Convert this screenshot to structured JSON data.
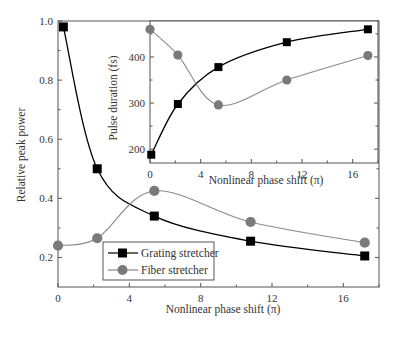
{
  "chart_data": [
    {
      "type": "line",
      "title": "",
      "xlabel": "Nonlinear phase shift (π)",
      "ylabel": "Relative peak power",
      "xlim": [
        0,
        18
      ],
      "ylim": [
        0.1,
        1.0
      ],
      "xticks": [
        "0",
        "4",
        "8",
        "12",
        "16"
      ],
      "yticks": [
        "0.2",
        "0.4",
        "0.6",
        "0.8",
        "1.0"
      ],
      "grid": false,
      "legend_position": "lower center",
      "series": [
        {
          "name": "Grating stretcher",
          "marker": "square",
          "color": "#000000",
          "x": [
            0.3,
            2.2,
            5.4,
            10.8,
            17.2
          ],
          "values": [
            0.98,
            0.5,
            0.34,
            0.255,
            0.205
          ]
        },
        {
          "name": "Fiber stretcher",
          "marker": "circle",
          "color": "#777777",
          "x": [
            0,
            2.2,
            5.4,
            10.8,
            17.2
          ],
          "values": [
            0.24,
            0.265,
            0.425,
            0.32,
            0.25
          ]
        }
      ]
    },
    {
      "type": "line",
      "title": "inset",
      "xlabel": "Nonlinear phase shift (π)",
      "ylabel": "Pulse duration (fs)",
      "xlim": [
        0,
        18
      ],
      "ylim": [
        170,
        478
      ],
      "xticks": [
        "0",
        "4",
        "8",
        "12",
        "16"
      ],
      "yticks": [
        "200",
        "300",
        "400"
      ],
      "grid": false,
      "series": [
        {
          "name": "Grating stretcher",
          "marker": "square",
          "color": "#000000",
          "x": [
            0.1,
            2.2,
            5.4,
            10.8,
            17.2
          ],
          "values": [
            188,
            298,
            378,
            432,
            460
          ]
        },
        {
          "name": "Fiber stretcher",
          "marker": "circle",
          "color": "#777777",
          "x": [
            0,
            2.2,
            5.4,
            10.8,
            17.2
          ],
          "values": [
            460,
            404,
            296,
            350,
            403
          ]
        }
      ]
    }
  ],
  "main": {
    "xlabel": "Nonlinear phase shift (π)",
    "ylabel": "Relative peak power",
    "xticks": [
      "0",
      "4",
      "8",
      "12",
      "16"
    ],
    "yticks": [
      "0.2",
      "0.4",
      "0.6",
      "0.8",
      "1.0"
    ]
  },
  "inset": {
    "xlabel": "Nonlinear phase shift (π)",
    "ylabel": "Pulse duration (fs)",
    "xticks": [
      "0",
      "4",
      "8",
      "12",
      "16"
    ],
    "yticks": [
      "200",
      "300",
      "400"
    ]
  },
  "legend": {
    "items": [
      {
        "label": "Grating stretcher",
        "icon": "square-marker"
      },
      {
        "label": "Fiber stretcher",
        "icon": "circle-marker"
      }
    ]
  }
}
